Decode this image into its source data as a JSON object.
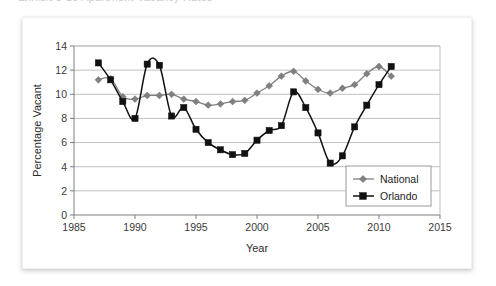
{
  "caption": {
    "text": "Exhibit 5-10    Apartment Vacancy Rates"
  },
  "chart_data": {
    "type": "line",
    "title": "",
    "xlabel": "Year",
    "ylabel": "Percentage Vacant",
    "xlim": [
      1985,
      2015
    ],
    "ylim": [
      0,
      14
    ],
    "xticks": [
      1985,
      1990,
      1995,
      2000,
      2005,
      2010,
      2015
    ],
    "yticks": [
      0,
      2,
      4,
      6,
      8,
      10,
      12,
      14
    ],
    "grid": "horizontal",
    "legend_position": "bottom-right",
    "x": [
      1987,
      1988,
      1989,
      1990,
      1991,
      1992,
      1993,
      1994,
      1995,
      1996,
      1997,
      1998,
      1999,
      2000,
      2001,
      2002,
      2003,
      2004,
      2005,
      2006,
      2007,
      2008,
      2009,
      2010,
      2011
    ],
    "series": [
      {
        "name": "National",
        "color": "#808080",
        "marker": "diamond",
        "values": [
          11.2,
          11.3,
          9.8,
          9.6,
          9.9,
          9.9,
          10.0,
          9.6,
          9.4,
          9.1,
          9.2,
          9.4,
          9.5,
          10.1,
          10.7,
          11.5,
          11.9,
          11.1,
          10.4,
          10.1,
          10.5,
          10.8,
          11.7,
          12.3,
          11.5
        ]
      },
      {
        "name": "Orlando",
        "color": "#111111",
        "marker": "square",
        "values": [
          12.6,
          11.2,
          9.4,
          8.0,
          12.5,
          12.4,
          8.2,
          8.9,
          7.1,
          6.0,
          5.4,
          5.0,
          5.1,
          6.2,
          7.0,
          7.4,
          10.2,
          8.9,
          6.8,
          4.3,
          4.9,
          7.3,
          9.1,
          10.8,
          12.3
        ]
      }
    ]
  },
  "legend": {
    "items": [
      {
        "label": "National"
      },
      {
        "label": "Orlando"
      }
    ]
  },
  "axes": {
    "y_title": "Percentage Vacant",
    "x_title": "Year",
    "y_tick_labels": [
      "0",
      "2",
      "4",
      "6",
      "8",
      "10",
      "12",
      "14"
    ],
    "x_tick_labels": [
      "1985",
      "1990",
      "1995",
      "2000",
      "2005",
      "2010",
      "2015"
    ]
  }
}
